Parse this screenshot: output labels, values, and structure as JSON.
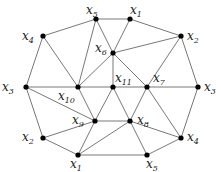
{
  "diagram": {
    "type": "graph",
    "nodes": [
      {
        "id": "x5t",
        "label": "x",
        "sub": "5",
        "x": 96,
        "y": 19,
        "lx": 86,
        "ly": 14
      },
      {
        "id": "x1t",
        "label": "x",
        "sub": "1",
        "x": 130,
        "y": 19,
        "lx": 130,
        "ly": 14
      },
      {
        "id": "x4l",
        "label": "x",
        "sub": "4",
        "x": 43,
        "y": 36,
        "lx": 22,
        "ly": 40
      },
      {
        "id": "x2r",
        "label": "x",
        "sub": "2",
        "x": 181,
        "y": 36,
        "lx": 187,
        "ly": 40
      },
      {
        "id": "x6",
        "label": "x",
        "sub": "6",
        "x": 113,
        "y": 53,
        "lx": 95,
        "ly": 52
      },
      {
        "id": "x3l",
        "label": "x",
        "sub": "3",
        "x": 26,
        "y": 87,
        "lx": 2,
        "ly": 91
      },
      {
        "id": "x10",
        "label": "x",
        "sub": "10",
        "x": 78,
        "y": 87,
        "lx": 58,
        "ly": 100
      },
      {
        "id": "x11",
        "label": "x",
        "sub": "11",
        "x": 113,
        "y": 87,
        "lx": 115,
        "ly": 82
      },
      {
        "id": "x7",
        "label": "x",
        "sub": "7",
        "x": 147,
        "y": 87,
        "lx": 153,
        "ly": 82
      },
      {
        "id": "x3r",
        "label": "x",
        "sub": "3",
        "x": 198,
        "y": 87,
        "lx": 204,
        "ly": 91
      },
      {
        "id": "x9",
        "label": "x",
        "sub": "9",
        "x": 95,
        "y": 121,
        "lx": 72,
        "ly": 124
      },
      {
        "id": "x8",
        "label": "x",
        "sub": "8",
        "x": 130,
        "y": 121,
        "lx": 137,
        "ly": 124
      },
      {
        "id": "x2b",
        "label": "x",
        "sub": "2",
        "x": 43,
        "y": 138,
        "lx": 22,
        "ly": 141
      },
      {
        "id": "x4b",
        "label": "x",
        "sub": "4",
        "x": 181,
        "y": 138,
        "lx": 187,
        "ly": 141
      },
      {
        "id": "x1b",
        "label": "x",
        "sub": "1",
        "x": 78,
        "y": 155,
        "lx": 70,
        "ly": 168
      },
      {
        "id": "x5b",
        "label": "x",
        "sub": "5",
        "x": 147,
        "y": 155,
        "lx": 146,
        "ly": 168
      }
    ],
    "edges": [
      [
        "x5t",
        "x1t"
      ],
      [
        "x4l",
        "x5t"
      ],
      [
        "x1t",
        "x2r"
      ],
      [
        "x4l",
        "x3l"
      ],
      [
        "x2r",
        "x3r"
      ],
      [
        "x3l",
        "x2b"
      ],
      [
        "x3r",
        "x4b"
      ],
      [
        "x2b",
        "x1b"
      ],
      [
        "x4b",
        "x5b"
      ],
      [
        "x1b",
        "x5b"
      ],
      [
        "x4l",
        "x10"
      ],
      [
        "x5t",
        "x10"
      ],
      [
        "x5t",
        "x6"
      ],
      [
        "x1t",
        "x6"
      ],
      [
        "x6",
        "x2r"
      ],
      [
        "x6",
        "x10"
      ],
      [
        "x6",
        "x11"
      ],
      [
        "x6",
        "x7"
      ],
      [
        "x2r",
        "x7"
      ],
      [
        "x3l",
        "x10"
      ],
      [
        "x10",
        "x11"
      ],
      [
        "x11",
        "x7"
      ],
      [
        "x7",
        "x3r"
      ],
      [
        "x10",
        "x9"
      ],
      [
        "x11",
        "x9"
      ],
      [
        "x11",
        "x8"
      ],
      [
        "x7",
        "x8"
      ],
      [
        "x7",
        "x4b"
      ],
      [
        "x3l",
        "x9"
      ],
      [
        "x2b",
        "x9"
      ],
      [
        "x9",
        "x8"
      ],
      [
        "x9",
        "x1b"
      ],
      [
        "x8",
        "x1b"
      ],
      [
        "x8",
        "x5b"
      ],
      [
        "x8",
        "x4b"
      ]
    ]
  }
}
